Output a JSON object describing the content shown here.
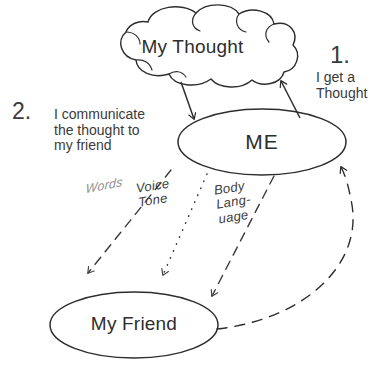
{
  "diagram": {
    "nodes": {
      "thought": "My Thought",
      "me": "ME",
      "friend": "My Friend"
    },
    "steps": [
      {
        "number": "1.",
        "text": "I get a\nThought"
      },
      {
        "number": "2.",
        "text": "I communicate\nthe thought to\nmy friend"
      }
    ],
    "channels": [
      {
        "label": "Words",
        "style": "dashed"
      },
      {
        "label": "Voice\nTone",
        "style": "dotted"
      },
      {
        "label": "Body\nLang-\nuage",
        "style": "dashed"
      }
    ],
    "colors": {
      "ink": "#2e2e2e",
      "text": "#3a3a3a",
      "faded": "#8e8e8e",
      "background": "#ffffff"
    }
  }
}
